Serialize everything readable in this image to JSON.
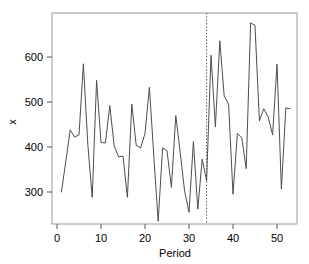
{
  "chart_data": {
    "type": "line",
    "title": "",
    "xlabel": "Period",
    "ylabel": "x",
    "xlim": [
      0.5,
      53.5
    ],
    "ylim": [
      225,
      690
    ],
    "xticks": [
      0,
      10,
      20,
      30,
      40,
      50
    ],
    "yticks": [
      300,
      400,
      500,
      600
    ],
    "grid": false,
    "legend": null,
    "line_color": "#4d4d4d",
    "annotations": [
      {
        "name": "forecast-origin-divider",
        "type": "vertical-dashed-line",
        "x": 34,
        "style": "dotted",
        "color": "#555555"
      }
    ],
    "x": [
      1,
      2,
      3,
      4,
      5,
      6,
      7,
      8,
      9,
      10,
      11,
      12,
      13,
      14,
      15,
      16,
      17,
      18,
      19,
      20,
      21,
      22,
      23,
      24,
      25,
      26,
      27,
      28,
      29,
      30,
      31,
      32,
      33,
      34,
      35,
      36,
      37,
      38,
      39,
      40,
      41,
      42,
      43,
      44,
      45,
      46,
      47,
      48,
      49,
      50,
      51,
      52,
      53
    ],
    "values": [
      300,
      368,
      438,
      422,
      427,
      585,
      406,
      288,
      548,
      410,
      409,
      492,
      402,
      378,
      380,
      288,
      495,
      404,
      398,
      430,
      533,
      380,
      235,
      398,
      392,
      310,
      470,
      388,
      302,
      255,
      412,
      262,
      373,
      325,
      604,
      445,
      636,
      513,
      495,
      295,
      430,
      420,
      352,
      676,
      670,
      458,
      485,
      467,
      427,
      584,
      306,
      487,
      485
    ],
    "series": [
      {
        "name": "x",
        "values": [
          300,
          368,
          438,
          422,
          427,
          585,
          406,
          288,
          548,
          410,
          409,
          492,
          402,
          378,
          380,
          288,
          495,
          404,
          398,
          430,
          533,
          380,
          235,
          398,
          392,
          310,
          470,
          388,
          302,
          255,
          412,
          262,
          373,
          325,
          604,
          445,
          636,
          513,
          495,
          295,
          430,
          420,
          352,
          676,
          670,
          458,
          485,
          467,
          427,
          584,
          306,
          487,
          485
        ]
      }
    ]
  },
  "axes": {
    "x_tick_labels": [
      "0",
      "10",
      "20",
      "30",
      "40",
      "50"
    ],
    "y_tick_labels": [
      "300",
      "400",
      "500",
      "600"
    ],
    "x_axis_title": "Period",
    "y_axis_title": "x"
  }
}
